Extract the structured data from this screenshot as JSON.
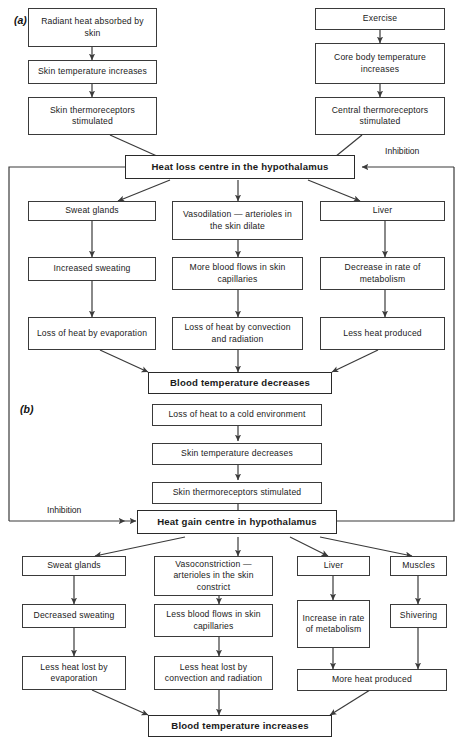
{
  "figure": {
    "panel_a_label": "(a)",
    "panel_b_label": "(b)",
    "inhibition_label_top": "Inhibition",
    "inhibition_label_bottom": "Inhibition"
  },
  "panel_a": {
    "left_chain": [
      "Radiant heat absorbed by skin",
      "Skin temperature increases",
      "Skin thermoreceptors stimulated"
    ],
    "right_chain": [
      "Exercise",
      "Core body temperature increases",
      "Central thermoreceptors stimulated"
    ],
    "centre": "Heat loss centre in the hypothalamus",
    "branches": [
      {
        "effector": "Sweat glands",
        "response": "Increased sweating",
        "outcome": "Loss of heat by evaporation"
      },
      {
        "effector": "Vasodilation — arterioles in the skin dilate",
        "response": "More blood flows in skin capillaries",
        "outcome": "Loss of heat by convection and radiation"
      },
      {
        "effector": "Liver",
        "response": "Decrease in rate of metabolism",
        "outcome": "Less heat produced"
      }
    ],
    "result": "Blood temperature decreases"
  },
  "panel_b": {
    "chain": [
      "Loss of heat to a cold environment",
      "Skin temperature decreases",
      "Skin thermoreceptors stimulated"
    ],
    "centre": "Heat gain centre in hypothalamus",
    "branches": [
      {
        "effector": "Sweat glands",
        "response": "Decreased sweating",
        "outcome": "Less heat lost by evaporation"
      },
      {
        "effector": "Vasoconstriction — arterioles in the skin constrict",
        "response": "Less blood flows in skin capillaries",
        "outcome": "Less heat lost by convection and radiation"
      },
      {
        "effector": "Liver",
        "response": "Increase in rate of metabolism",
        "outcome": "More heat produced"
      },
      {
        "effector": "Muscles",
        "response": "Shivering",
        "outcome": "More heat produced"
      }
    ],
    "result": "Blood temperature increases"
  },
  "colors": {
    "line": "#3a3a3a",
    "text": "#1a1a1a",
    "background": "#ffffff"
  }
}
